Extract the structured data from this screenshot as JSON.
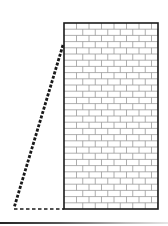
{
  "diagram": {
    "colors": {
      "background": "#ffffff",
      "wall_outline": "#1a1a1a",
      "mortar": "#9a9a9a",
      "brick_fill": "#ffffff",
      "ladder": "#1a1a1a",
      "ground_dash": "#1a1a1a"
    },
    "wall": {
      "x": 64,
      "y": 23,
      "width": 94,
      "height": 186,
      "brick_width": 12.5,
      "brick_height": 6.2
    },
    "ladder": {
      "top": {
        "x": 63,
        "y": 45
      },
      "bottom": {
        "x": 14,
        "y": 208
      }
    },
    "ground": {
      "from": {
        "x": 14,
        "y": 209
      },
      "to": {
        "x": 64,
        "y": 209
      }
    }
  }
}
